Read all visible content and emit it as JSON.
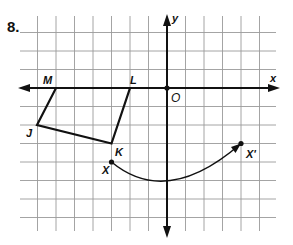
{
  "problem_number": "8.",
  "axes": {
    "x_label": "x",
    "y_label": "y",
    "origin_label": "O"
  },
  "grid": {
    "origin_px": [
      167,
      88
    ],
    "unit_px": 18.5,
    "x_range": [
      -8,
      6
    ],
    "y_range": [
      -8,
      4
    ]
  },
  "points": [
    {
      "name": "M",
      "x": -6,
      "y": 0
    },
    {
      "name": "L",
      "x": -2,
      "y": 0
    },
    {
      "name": "K",
      "x": -3,
      "y": -3
    },
    {
      "name": "J",
      "x": -7,
      "y": -2
    },
    {
      "name": "X",
      "x": -3,
      "y": -4
    },
    {
      "name": "X'",
      "x": 4,
      "y": -3
    }
  ],
  "polygon": [
    "M",
    "L",
    "K",
    "J"
  ],
  "arc": {
    "from": "X",
    "to": "X'",
    "arrow_at": "X'"
  },
  "colors": {
    "grid": "#9a9a9a",
    "ink": "#111111"
  }
}
